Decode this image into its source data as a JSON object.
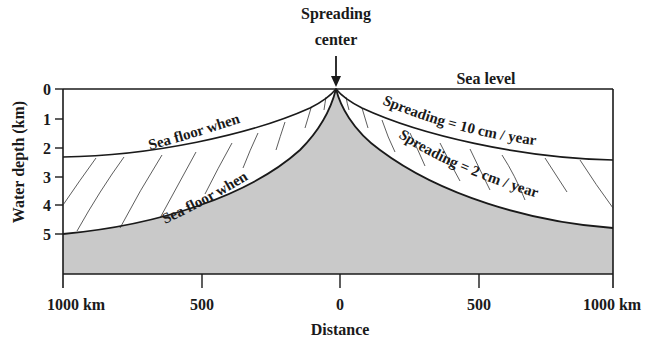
{
  "title": {
    "line1": "Spreading",
    "line2": "center"
  },
  "sea_level_label": "Sea level",
  "y_axis": {
    "label": "Water depth (km)",
    "ticks": [
      "0",
      "1",
      "2",
      "3",
      "4",
      "5"
    ]
  },
  "x_axis": {
    "label": "Distance",
    "ticks": [
      "1000 km",
      "500",
      "0",
      "500",
      "1000 km"
    ]
  },
  "curve_labels": {
    "left_upper": "Sea floor when",
    "left_lower": "Sea floor when",
    "right_upper": "Spreading = 10 cm / year",
    "right_lower": "Spreading = 2 cm / year"
  },
  "colors": {
    "seafloor_fill": "#c9c9c9",
    "line": "#1a1a1a",
    "background": "#ffffff"
  }
}
